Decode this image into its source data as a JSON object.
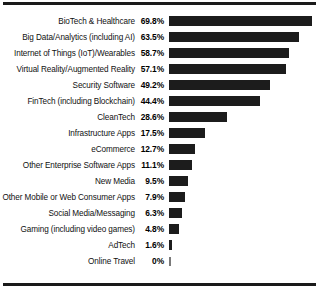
{
  "chart_data": {
    "type": "bar",
    "orientation": "horizontal",
    "title": "",
    "subtitle": "",
    "xlabel": "",
    "ylabel": "",
    "xlim": [
      0,
      70
    ],
    "grid": false,
    "legend": null,
    "value_suffix": "%",
    "categories": [
      "BioTech & Healthcare",
      "Big Data/Analytics (including AI)",
      "Internet of Things (IoT)/Wearables",
      "Virtual Reality/Augmented Reality",
      "Security Software",
      "FinTech (including Blockchain)",
      "CleanTech",
      "Infrastructure Apps",
      "eCommerce",
      "Other Enterprise Software Apps",
      "New Media",
      "Other Mobile or Web Consumer Apps",
      "Social Media/Messaging",
      "Gaming (including video games)",
      "AdTech",
      "Online Travel"
    ],
    "values": [
      69.8,
      63.5,
      58.7,
      57.1,
      49.2,
      44.4,
      28.6,
      17.5,
      12.7,
      11.1,
      9.5,
      7.9,
      6.3,
      4.8,
      1.6,
      0
    ],
    "value_labels": [
      "69.8%",
      "63.5%",
      "58.7%",
      "57.1%",
      "49.2%",
      "44.4%",
      "28.6%",
      "17.5%",
      "12.7%",
      "11.1%",
      "9.5%",
      "7.9%",
      "6.3%",
      "4.8%",
      "1.6%",
      "0%"
    ],
    "bar_color": "#1c1c1c",
    "rule_color": "#1a1a1a"
  }
}
